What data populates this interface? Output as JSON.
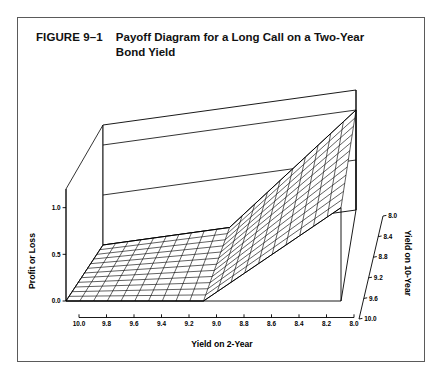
{
  "figure": {
    "label": "FIGURE 9–1",
    "title": "Payoff Diagram for a Long Call on a Two-Year Bond Yield"
  },
  "chart_data": {
    "type": "surface",
    "title": "Payoff Diagram for a Long Call on a Two-Year Bond Yield",
    "xlabel": "Yield on 2-Year",
    "ylabel": "Yield on 10-Year",
    "zlabel": "Profit or Loss",
    "x_ticks": [
      "10.0",
      "9.8",
      "9.6",
      "9.4",
      "9.2",
      "9.0",
      "8.8",
      "8.6",
      "8.4",
      "8.2",
      "8.0"
    ],
    "x_tick_values": [
      10.0,
      9.8,
      9.6,
      9.4,
      9.2,
      9.0,
      8.8,
      8.6,
      8.4,
      8.2,
      8.0
    ],
    "y_ticks": [
      "10.0",
      "9.6",
      "9.2",
      "8.8",
      "8.4",
      "8.0"
    ],
    "y_tick_values": [
      10.0,
      9.6,
      9.2,
      8.8,
      8.4,
      8.0
    ],
    "z_ticks": [
      "1.0",
      "0.5",
      "0.0"
    ],
    "z_tick_values": [
      1.0,
      0.5,
      0.0
    ],
    "xlim": [
      10.0,
      8.0
    ],
    "ylim": [
      10.0,
      8.0
    ],
    "zlim": [
      0.0,
      1.2
    ],
    "strike": 9.0,
    "payoff_rule": "max(strike - x, 0)",
    "surface_values": {
      "at_x_10.0": 0.0,
      "at_x_9.8": 0.0,
      "at_x_9.6": 0.0,
      "at_x_9.4": 0.0,
      "at_x_9.2": 0.0,
      "at_x_9.0": 0.0,
      "at_x_8.8": 0.2,
      "at_x_8.6": 0.4,
      "at_x_8.4": 0.6,
      "at_x_8.2": 0.8,
      "at_x_8.0": 1.0
    },
    "grid": true,
    "legend": false,
    "colors": {
      "line": "#000000",
      "frame": "#5a5a5a",
      "background": "#ffffff"
    }
  }
}
